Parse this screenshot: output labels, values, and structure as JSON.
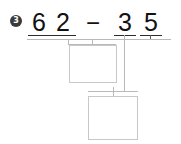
{
  "problem": {
    "number_label": "3",
    "equation": {
      "minuend_tens": "6",
      "minuend_ones": "2",
      "operator": "−",
      "subtrahend_tens": "3",
      "subtrahend_ones": "5"
    },
    "work_boxes": {
      "upper_value": "",
      "lower_value": ""
    }
  },
  "colors": {
    "digit": "#111111",
    "badge_bg": "#3b3b3b",
    "badge_text": "#ffffff",
    "rule": "#b9b9b9",
    "underline": "#2b2b2b",
    "box_border": "#c8c8c8",
    "page_bg": "#ffffff"
  }
}
